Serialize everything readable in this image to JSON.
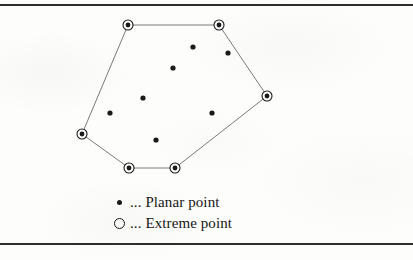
{
  "figure": {
    "background_color": "#fdfdfc",
    "ink_color": "#1a1a1a",
    "rule_color": "#2e2e2e",
    "hull_edge_color": "#6b6b6b"
  },
  "rules": {
    "top_label": "top-rule",
    "bottom_label": "bottom-rule"
  },
  "chart_data": {
    "type": "scatter",
    "title": "",
    "xlabel": "",
    "ylabel": "",
    "xlim": [
      0,
      413
    ],
    "ylim": [
      260,
      0
    ],
    "grid": false,
    "legend_position": "bottom-center",
    "series": [
      {
        "name": "Planar point",
        "marker": "filled-circle",
        "color": "#1a1a1a",
        "points": [
          {
            "x": 193,
            "y": 47
          },
          {
            "x": 228,
            "y": 53
          },
          {
            "x": 173,
            "y": 68
          },
          {
            "x": 143,
            "y": 98
          },
          {
            "x": 110,
            "y": 113
          },
          {
            "x": 212,
            "y": 113
          },
          {
            "x": 156,
            "y": 140
          }
        ]
      },
      {
        "name": "Extreme point",
        "marker": "ringed-filled-circle",
        "color": "#1a1a1a",
        "points": [
          {
            "x": 128,
            "y": 25
          },
          {
            "x": 219,
            "y": 25
          },
          {
            "x": 267,
            "y": 96
          },
          {
            "x": 175,
            "y": 168
          },
          {
            "x": 129,
            "y": 168
          },
          {
            "x": 82,
            "y": 134
          }
        ]
      }
    ],
    "hull_polygon": [
      {
        "x": 128,
        "y": 25
      },
      {
        "x": 219,
        "y": 25
      },
      {
        "x": 267,
        "y": 96
      },
      {
        "x": 175,
        "y": 168
      },
      {
        "x": 129,
        "y": 168
      },
      {
        "x": 82,
        "y": 134
      }
    ],
    "annotations": []
  },
  "legend": {
    "rows": [
      {
        "marker": "filled-dot",
        "text": "... Planar point"
      },
      {
        "marker": "open-circle",
        "text": "... Extreme point"
      }
    ]
  }
}
